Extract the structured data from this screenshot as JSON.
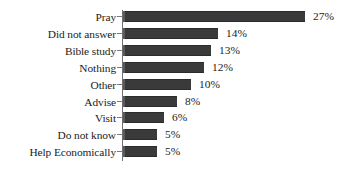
{
  "chart_data": {
    "type": "bar",
    "orientation": "horizontal",
    "title": "",
    "xlabel": "",
    "ylabel": "",
    "grid": false,
    "legend": null,
    "xlim": [
      0,
      27
    ],
    "value_suffix": "%",
    "categories": [
      "Pray",
      "Did not answer",
      "Bible study",
      "Nothing",
      "Other",
      "Advise",
      "Visit",
      "Do not know",
      "Help Economically"
    ],
    "values": [
      27,
      14,
      13,
      12,
      10,
      8,
      6,
      5,
      5
    ],
    "data_labels": [
      "27%",
      "14%",
      "13%",
      "12%",
      "10%",
      "8%",
      "6%",
      "5%",
      "5%"
    ],
    "bar_color": "#3a3a3a",
    "background_color": "#ffffff",
    "axis_color": "#6f6f6f",
    "text_color": "#1c1c1c"
  },
  "rows": [
    {
      "label": "Pray",
      "value": 27,
      "data_label": "27%"
    },
    {
      "label": "Did not answer",
      "value": 14,
      "data_label": "14%"
    },
    {
      "label": "Bible study",
      "value": 13,
      "data_label": "13%"
    },
    {
      "label": "Nothing",
      "value": 12,
      "data_label": "12%"
    },
    {
      "label": "Other",
      "value": 10,
      "data_label": "10%"
    },
    {
      "label": "Advise",
      "value": 8,
      "data_label": "8%"
    },
    {
      "label": "Visit",
      "value": 6,
      "data_label": "6%"
    },
    {
      "label": "Do not know",
      "value": 5,
      "data_label": "5%"
    },
    {
      "label": "Help Economically",
      "value": 5,
      "data_label": "5%"
    }
  ],
  "title_remnant": ""
}
